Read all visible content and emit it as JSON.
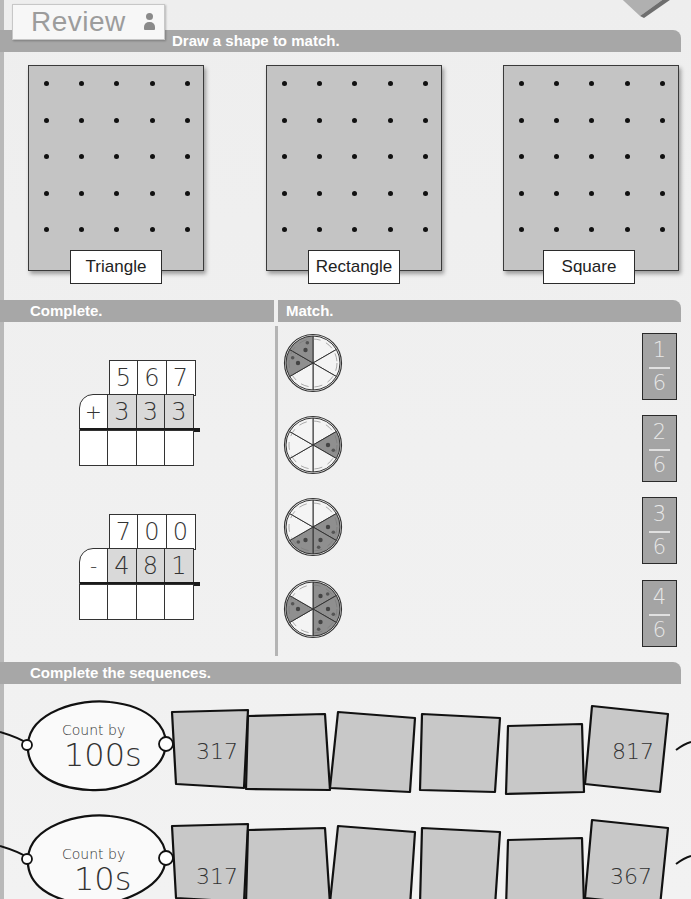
{
  "header": {
    "badge": "Review",
    "badge_icon": "person-icon",
    "instruction": "Draw a shape to match."
  },
  "geoboards": [
    {
      "label": "Triangle",
      "rows": 5,
      "cols": 5
    },
    {
      "label": "Rectangle",
      "rows": 5,
      "cols": 5
    },
    {
      "label": "Square",
      "rows": 5,
      "cols": 5
    }
  ],
  "complete_section": {
    "title": "Complete.",
    "problems": [
      {
        "operator": "+",
        "top": [
          "5",
          "6",
          "7"
        ],
        "bottom": [
          "3",
          "3",
          "3"
        ],
        "answer": [
          "",
          "",
          "",
          ""
        ]
      },
      {
        "operator": "-",
        "top": [
          "7",
          "0",
          "0"
        ],
        "bottom": [
          "4",
          "8",
          "1"
        ],
        "answer": [
          "",
          "",
          "",
          ""
        ]
      }
    ]
  },
  "match_section": {
    "title": "Match.",
    "pizzas": [
      {
        "slices": 6,
        "topped": 2
      },
      {
        "slices": 6,
        "topped": 1
      },
      {
        "slices": 6,
        "topped": 3
      },
      {
        "slices": 6,
        "topped": 4
      }
    ],
    "fractions": [
      {
        "numerator": "1",
        "denominator": "6"
      },
      {
        "numerator": "2",
        "denominator": "6"
      },
      {
        "numerator": "3",
        "denominator": "6"
      },
      {
        "numerator": "4",
        "denominator": "6"
      }
    ]
  },
  "sequences_section": {
    "title": "Complete the sequences.",
    "sequences": [
      {
        "label_small": "Count by",
        "label_big": "100s",
        "values": [
          "317",
          "",
          "",
          "",
          "",
          "817"
        ]
      },
      {
        "label_small": "Count by",
        "label_big": "10s",
        "values": [
          "317",
          "",
          "",
          "",
          "",
          "367"
        ]
      }
    ]
  },
  "colors": {
    "bar": "#a7a7a7",
    "page": "#eeeeee",
    "board": "#c4c4c4",
    "shaded_cell": "#d9d9d9",
    "card": "#a4a4a4"
  }
}
